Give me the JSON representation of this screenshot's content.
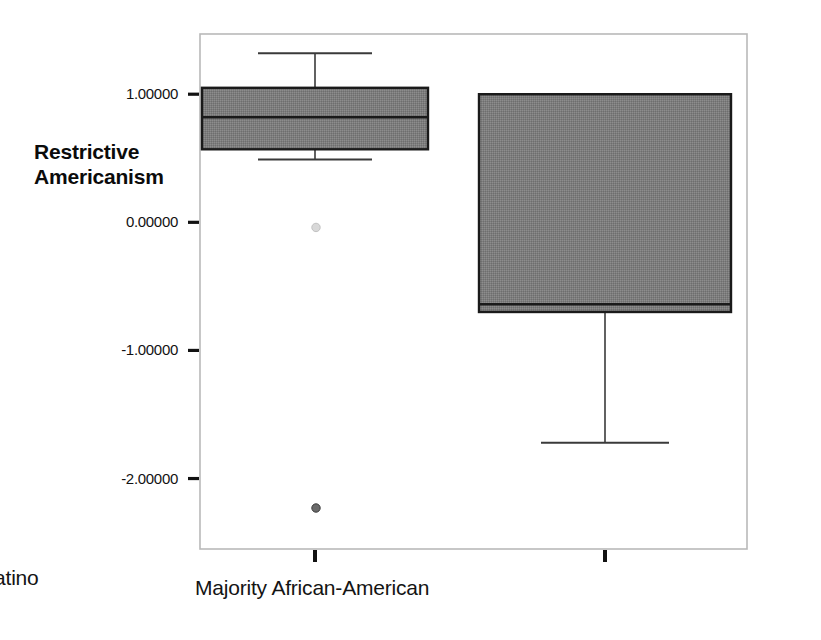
{
  "chart_data": {
    "type": "box",
    "title": "",
    "xlabel": "",
    "ylabel": "Restrictive Americanism",
    "ylabel_line1": "Restrictive",
    "ylabel_line2": "Americanism",
    "categories": [
      "Majority Latino",
      "Majority African-American"
    ],
    "ytick_labels": [
      "1.00000",
      "0.00000",
      "-1.00000",
      "-2.00000"
    ],
    "ytick_values": [
      1.0,
      0.0,
      -1.0,
      -2.0
    ],
    "ylim": [
      -2.55,
      1.47
    ],
    "grid": false,
    "legend": "none",
    "box_fill_color": "#7d7d7d",
    "box_edge_color": "#1a1a1a",
    "frame_color": "#b9b9b9",
    "boxes": [
      {
        "category": "Majority Latino",
        "whisker_high": 1.32,
        "q3": 1.05,
        "median": 0.82,
        "q1": 0.57,
        "whisker_low": 0.49,
        "outliers": [
          -0.04,
          -2.23
        ]
      },
      {
        "category": "Majority African-American",
        "whisker_high": 1.0,
        "q3": 1.0,
        "median": -0.64,
        "q1": -0.7,
        "whisker_low": -1.72,
        "outliers": []
      }
    ]
  }
}
